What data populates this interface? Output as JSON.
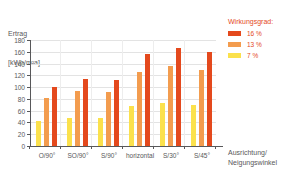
{
  "chart_data": {
    "type": "bar",
    "title": "",
    "ylabel": "Ertrag [kWh/m²a]",
    "ylabel_line1": "Ertrag",
    "ylabel_line2": "[kWh/m²a]",
    "xlabel": "Ausrichtung/ Neigungswinkel",
    "xlabel_line1": "Ausrichtung/",
    "xlabel_line2": "Neigungswinkel",
    "ylim": [
      0,
      180
    ],
    "ytick_step": 20,
    "yticks": [
      0,
      20,
      40,
      60,
      80,
      100,
      120,
      140,
      160,
      180
    ],
    "grid": true,
    "legend_position": "right",
    "legend_title": "Wirkungsgrad:",
    "categories": [
      "O/90°",
      "SO/90°",
      "S/90°",
      "horizontal",
      "S/30°",
      "S/45°"
    ],
    "series": [
      {
        "name": "16 %",
        "color": "#e4491d",
        "values": [
          101,
          114,
          112,
          156,
          167,
          160
        ]
      },
      {
        "name": "13 %",
        "color": "#f39c4e",
        "values": [
          82,
          93,
          91,
          126,
          136,
          129
        ]
      },
      {
        "name": "7 %",
        "color": "#fbe14c",
        "values": [
          42,
          48,
          47,
          68,
          73,
          70
        ]
      }
    ]
  },
  "colors": {
    "axis": "#58585a",
    "grid": "#e3e3e3",
    "accent": "#e4491d",
    "series_16": "#e4491d",
    "series_13": "#f39c4e",
    "series_7": "#fbe14c"
  }
}
